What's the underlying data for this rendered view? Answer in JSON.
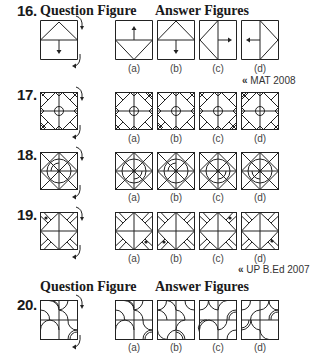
{
  "questions": [
    {
      "number": "16.",
      "headers": {
        "question": "Question Figure",
        "answers": "Answer Figures"
      },
      "answer_labels": [
        "(a)",
        "(b)",
        "(c)",
        "(d)"
      ],
      "source": "MAT 2008",
      "figure": "square split horizontally, triangle in top half, down arrow in bottom half; rotation arrows on right side"
    },
    {
      "number": "17.",
      "answer_labels": [
        "(a)",
        "(b)",
        "(c)",
        "(d)"
      ],
      "figure": "X-shaped cross pattern with central circle and corner triangles"
    },
    {
      "number": "18.",
      "answer_labels": [
        "(a)",
        "(b)",
        "(c)",
        "(d)"
      ],
      "figure": "square with diagonals, center lines, concentric circles and a small arc"
    },
    {
      "number": "19.",
      "answer_labels": [
        "(a)",
        "(b)",
        "(c)",
        "(d)"
      ],
      "source": "UP B.Ed 2007",
      "figure": "four-arm cross pattern with a dot in one corner"
    },
    {
      "number": "20.",
      "headers": {
        "question": "Question Figure",
        "answers": "Answer Figures"
      },
      "answer_labels": [
        "(a)",
        "(b)",
        "(c)",
        "(d)"
      ],
      "figure": "2x2 grid of quarter-circle arcs, some doubled"
    }
  ],
  "icons": {
    "source_marker": "«",
    "rotation_arrow": "curved-clockwise-arrow"
  }
}
